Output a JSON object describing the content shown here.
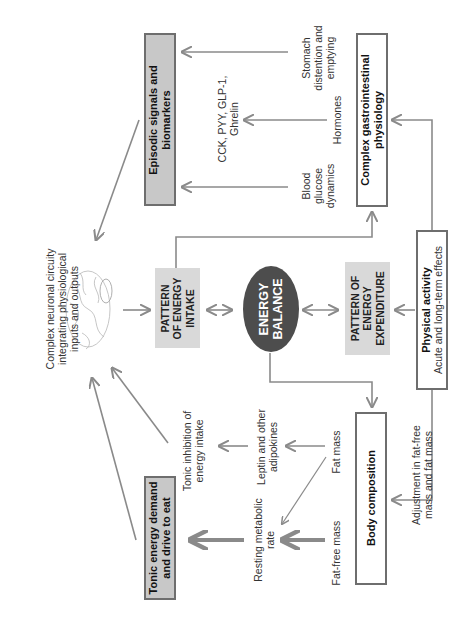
{
  "diagram": {
    "orientation": "rotated-90-ccw",
    "colors": {
      "arrow": "#8a8a8a",
      "box_border": "#6e6e6e",
      "gray_box": "#c8c8c8",
      "light_box": "#d9d9d9",
      "ellipse": "#4d4d4d",
      "ellipse_text": "#ffffff"
    },
    "brain": {
      "label": "Complex neuronal circuity integrating physiological inputs and outputs",
      "lines": [
        "Complex neuronal circuity",
        "integrating physiological",
        "inputs and outputs"
      ]
    },
    "nodes": {
      "episodic": {
        "lines": [
          "Episodic signals and",
          "biomarkers"
        ]
      },
      "gi_physiology": {
        "lines": [
          "Complex gastrointestinal",
          "physiology"
        ]
      },
      "physical_activity": {
        "title": "Physical activity",
        "subtitle": "Acute and long-term effects"
      },
      "intake": {
        "lines": [
          "PATTERN",
          "OF ENERGY",
          "INTAKE"
        ]
      },
      "balance": {
        "lines": [
          "ENERGY",
          "BALANCE"
        ]
      },
      "expenditure": {
        "lines": [
          "PATTERN OF",
          "ENERGY",
          "EXPENDITURE"
        ]
      },
      "body_composition": {
        "label": "Body composition"
      },
      "tonic_demand": {
        "lines": [
          "Tonic energy demand",
          "and drive to eat"
        ]
      }
    },
    "labels": {
      "cck": {
        "lines": [
          "CCK, PYY, GLP-1,",
          "Ghrelin"
        ]
      },
      "stomach": {
        "lines": [
          "Stomach",
          "distention and",
          "emptying"
        ]
      },
      "hormones": {
        "lines": [
          "Hormones"
        ]
      },
      "blood_glucose": {
        "lines": [
          "Blood",
          "glucose",
          "dynamics"
        ]
      },
      "tonic_inhibition": {
        "lines": [
          "Tonic inhibition of",
          "energy intake"
        ]
      },
      "leptin": {
        "lines": [
          "Leptin and other",
          "adipokines"
        ]
      },
      "rmr": {
        "lines": [
          "Resting metabolic",
          "rate"
        ]
      },
      "fat_mass": {
        "lines": [
          "Fat mass"
        ]
      },
      "fat_free_mass": {
        "lines": [
          "Fat-free mass"
        ]
      },
      "adjustment": {
        "lines": [
          "Adjustment in fat-free",
          "mass and fat mass"
        ]
      }
    }
  }
}
